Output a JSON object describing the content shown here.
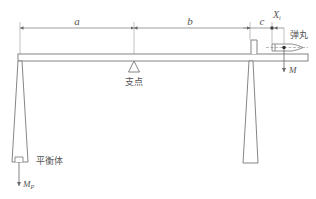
{
  "diagram": {
    "type": "ballistic-pendulum-balance schematic",
    "colors": {
      "stroke": "#777777",
      "text": "#555555",
      "background": "#ffffff"
    },
    "dimensions": {
      "a": {
        "label": "a",
        "from": "left-pendulum",
        "to": "fulcrum"
      },
      "b": {
        "label": "b",
        "from": "fulcrum",
        "to": "right-pendulum"
      },
      "c": {
        "label": "c",
        "from": "right-pendulum",
        "to": "bullet-center"
      },
      "xi": {
        "label": "X",
        "sub": "i"
      }
    },
    "labels": {
      "fulcrum": "支点",
      "bullet": "弹丸",
      "counterweight": "平衡体",
      "force_bullet": "M",
      "force_counterweight": "M",
      "force_counterweight_sub": "P"
    }
  }
}
